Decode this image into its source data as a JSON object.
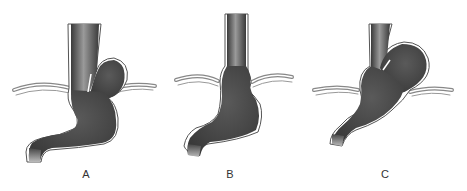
{
  "figure": {
    "panels": [
      {
        "id": "A",
        "label": "A"
      },
      {
        "id": "B",
        "label": "B"
      },
      {
        "id": "C",
        "label": "C"
      }
    ],
    "colors": {
      "organ_fill": "#4a4a4a",
      "organ_highlight": "#8a8a8a",
      "outline": "#222222",
      "diaphragm": "#9a9a9a",
      "background": "#ffffff"
    }
  }
}
